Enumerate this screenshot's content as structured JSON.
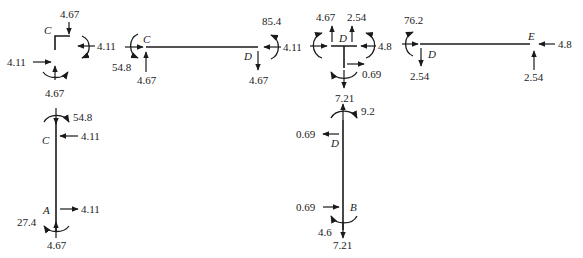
{
  "diagram": {
    "colors": {
      "ink": "#1a1a1a",
      "background": "#ffffff"
    },
    "joint_C": {
      "label": "C",
      "forces": {
        "top": "4.67",
        "right": "4.11",
        "left": "4.11",
        "bottom": "4.67"
      }
    },
    "member_CA": {
      "label_top": "C",
      "label_bottom": "A",
      "moment_top": "54.8",
      "force_top": "4.11",
      "force_bottom": "4.11",
      "moment_bottom": "27.4",
      "reaction_bottom": "4.67"
    },
    "member_CD": {
      "label_left": "C",
      "label_right": "D",
      "moment_left": "54.8",
      "force_left_h": "4.11",
      "force_left_v": "4.67",
      "moment_right": "85.4",
      "force_right_h": "4.11",
      "force_right_v": "4.67"
    },
    "joint_D": {
      "label": "D",
      "force_up_left": "4.67",
      "force_up_right": "2.54",
      "force_left": "4.11",
      "force_right": "4.8",
      "force_stem": "0.69",
      "force_down": "7.21"
    },
    "member_DE": {
      "label_left": "D",
      "label_right": "E",
      "moment_left": "76.2",
      "force_left_v": "2.54",
      "force_right_h": "4.8",
      "force_right_v": "2.54"
    },
    "member_DB": {
      "label_top": "D",
      "label_bottom": "B",
      "force_top_v": "7.21",
      "moment_top": "9.2",
      "force_top_h": "0.69",
      "force_bottom_h": "0.69",
      "moment_bottom": "4.6",
      "force_bottom_v": "7.21"
    }
  }
}
